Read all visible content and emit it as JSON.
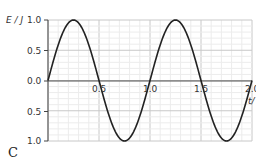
{
  "chart_data": {
    "type": "line",
    "title": "",
    "panel_label": "C",
    "ylabel": "E / J",
    "xlabel": "t / s",
    "xlim": [
      0,
      2.0
    ],
    "ylim": [
      -1.0,
      1.0
    ],
    "x_ticks": [
      "0.5",
      "1.0",
      "1.5",
      "2.0"
    ],
    "y_ticks": [
      "1.0",
      "0.5",
      "0.0",
      "0.5",
      "1.0"
    ],
    "grid": true,
    "series": [
      {
        "name": "E",
        "function": "sin(2*pi*t)",
        "x": [
          0,
          0.25,
          0.5,
          0.75,
          1.0,
          1.25,
          1.5,
          1.75,
          2.0
        ],
        "values": [
          0,
          1.0,
          0,
          -1.0,
          0,
          1.0,
          0,
          -1.0,
          0
        ]
      }
    ]
  },
  "labels": {
    "y_axis": "E / J",
    "x_axis": "t/",
    "panel": "C",
    "y_tick_top": "1.0",
    "y_tick_half": "0.5",
    "y_tick_zero": "0.0",
    "y_tick_neg_half": "0.5",
    "y_tick_bottom": "1.0",
    "x_tick_1": "0.5",
    "x_tick_2": "1.0",
    "x_tick_3": "1.5",
    "x_tick_4": "2.0"
  }
}
